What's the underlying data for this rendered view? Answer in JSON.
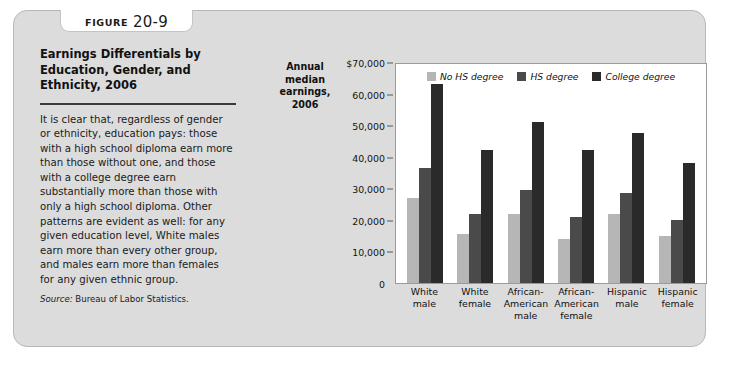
{
  "figure": {
    "tab_word": "FIGURE",
    "tab_number": "20-9",
    "title": "Earnings Differentials by Education, Gender, and Ethnicity, 2006",
    "body": "It is clear that, regardless of gender or ethnicity, education pays: those with a high school diploma earn more than those without one, and those with a college degree earn substantially more than those with only a high school diploma. Other patterns are evident as well: for any given education level, White males earn more than every other group, and males earn more than females for any given ethnic group.",
    "source_label": "Source:",
    "source_text": "Bureau of Labor Statistics."
  },
  "chart_data": {
    "type": "bar",
    "title": "Earnings Differentials by Education, Gender, and Ethnicity, 2006",
    "ylabel": "Annual median earnings, 2006",
    "xlabel": "",
    "categories": [
      "White male",
      "White female",
      "African-American male",
      "African-American female",
      "Hispanic male",
      "Hispanic female"
    ],
    "category_lines": [
      [
        "White",
        "male"
      ],
      [
        "White",
        "female"
      ],
      [
        "African-",
        "American",
        "male"
      ],
      [
        "African-",
        "American",
        "female"
      ],
      [
        "Hispanic",
        "male"
      ],
      [
        "Hispanic",
        "female"
      ]
    ],
    "series": [
      {
        "name": "No HS degree",
        "color": "#b6b6b6",
        "values": [
          27000,
          15500,
          22000,
          14000,
          22000,
          15000
        ]
      },
      {
        "name": "HS degree",
        "color": "#4a4a4a",
        "values": [
          36500,
          22000,
          29500,
          21000,
          28500,
          20000
        ]
      },
      {
        "name": "College degree",
        "color": "#2a2a2a",
        "values": [
          63000,
          42000,
          51000,
          42000,
          47500,
          38000
        ]
      }
    ],
    "ylim": [
      0,
      70000
    ],
    "ytick_values": [
      70000,
      60000,
      50000,
      40000,
      30000,
      20000,
      10000,
      0
    ],
    "ytick_labels": [
      "$70,000",
      "60,000",
      "50,000",
      "40,000",
      "30,000",
      "20,000",
      "10,000",
      "0"
    ],
    "grid": false,
    "legend_position": "top-center"
  }
}
